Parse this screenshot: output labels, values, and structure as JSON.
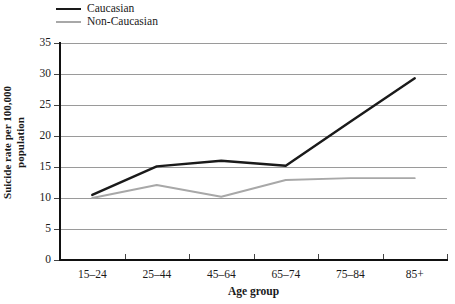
{
  "chart_data": {
    "type": "line",
    "title": "",
    "xlabel": "Age group",
    "ylabel": "Suicide rate per 100,000 population",
    "categories": [
      "15–24",
      "25–44",
      "45–64",
      "65–74",
      "75–84",
      "85+"
    ],
    "ylim": [
      0,
      35
    ],
    "ytick_step": 5,
    "yticks": [
      "35",
      "30",
      "25",
      "20",
      "15",
      "10",
      "5",
      "0"
    ],
    "grid": true,
    "legend_position": "top-left",
    "series": [
      {
        "name": "Caucasian",
        "color": "#1a1a1a",
        "values": [
          10.5,
          15.1,
          16.0,
          15.2,
          22.3,
          29.3
        ]
      },
      {
        "name": "Non-Caucasian",
        "color": "#a8a8a8",
        "values": [
          10.0,
          12.1,
          10.2,
          12.9,
          13.2,
          13.2
        ]
      }
    ]
  },
  "ytitle_lines": [
    "Suicide rate per 100,000",
    "population"
  ],
  "colors": {
    "caucasian": "#1a1a1a",
    "non_caucasian": "#a8a8a8",
    "gridline": "#9a9a9a",
    "axis": "#111111",
    "background": "#ffffff"
  }
}
